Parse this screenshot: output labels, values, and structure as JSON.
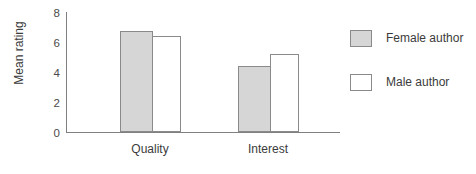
{
  "chart_data": {
    "type": "bar",
    "title": "",
    "xlabel": "",
    "ylabel": "Mean rating",
    "categories": [
      "Quality",
      "Interest"
    ],
    "series": [
      {
        "name": "Female author",
        "values": [
          6.7,
          4.4
        ],
        "color": "#d6d6d6"
      },
      {
        "name": "Male author",
        "values": [
          6.4,
          5.2
        ],
        "color": "#ffffff"
      }
    ],
    "ylim": [
      0,
      8
    ],
    "yticks": [
      0,
      2,
      4,
      6,
      8
    ],
    "ytick_labels": [
      "0",
      "2",
      "4",
      "6",
      "8"
    ],
    "grid": false,
    "legend_position": "right"
  },
  "axes": {
    "y_title": "Mean rating",
    "tick_0": "0",
    "tick_2": "2",
    "tick_4": "4",
    "tick_6": "6",
    "tick_8": "8"
  },
  "categories": {
    "quality": "Quality",
    "interest": "Interest"
  },
  "legend": {
    "female": "Female author",
    "male": "Male author"
  }
}
